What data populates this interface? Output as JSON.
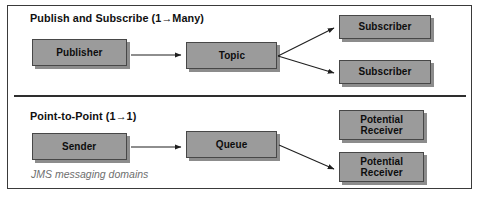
{
  "figure": {
    "caption": "JMS messaging domains"
  },
  "sections": [
    {
      "id": "publish-subscribe",
      "title": "Publish and Subscribe  (1→Many)",
      "nodes": [
        {
          "id": "publisher",
          "label": "Publisher"
        },
        {
          "id": "topic",
          "label": "Topic"
        },
        {
          "id": "subscriber-1",
          "label": "Subscriber"
        },
        {
          "id": "subscriber-2",
          "label": "Subscriber"
        }
      ],
      "connections": [
        {
          "from": "publisher",
          "to": "topic"
        },
        {
          "from": "topic",
          "to": "subscriber-1"
        },
        {
          "from": "topic",
          "to": "subscriber-2"
        }
      ]
    },
    {
      "id": "point-to-point",
      "title": "Point-to-Point (1→1)",
      "nodes": [
        {
          "id": "sender",
          "label": "Sender"
        },
        {
          "id": "queue",
          "label": "Queue"
        },
        {
          "id": "potential-receiver-1",
          "label": "Potential\nReceiver"
        },
        {
          "id": "potential-receiver-2",
          "label": "Potential\nReceiver"
        }
      ],
      "connections": [
        {
          "from": "sender",
          "to": "queue"
        },
        {
          "from": "queue",
          "to": "potential-receiver-2"
        }
      ]
    }
  ],
  "colors": {
    "node_fill": "#9b9b9b",
    "node_border": "#474747",
    "node_shadow": "#787878",
    "divider": "#2e2e2e",
    "frame_border": "#3a3a3a",
    "text": "#0d0d0d",
    "caption_text": "#6e6e6e",
    "background": "#ffffff"
  }
}
